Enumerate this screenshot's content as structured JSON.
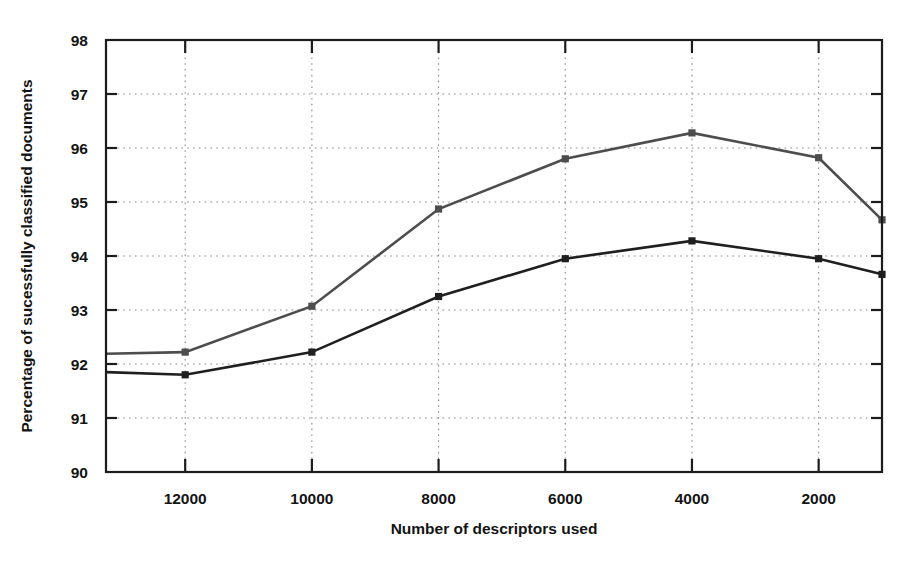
{
  "chart_data": {
    "type": "line",
    "title": "",
    "xlabel": "Number of descriptors used",
    "ylabel": "Percentage of sucessfully classified documents",
    "x": [
      13250,
      12000,
      10000,
      8000,
      6000,
      4000,
      2000,
      1000
    ],
    "xtick_labels": [
      "12000",
      "10000",
      "8000",
      "6000",
      "4000",
      "2000"
    ],
    "xticks": [
      12000,
      10000,
      8000,
      6000,
      4000,
      2000
    ],
    "xlim": [
      13250,
      1000
    ],
    "x_axis_reversed": true,
    "ytick_labels": [
      "90",
      "91",
      "92",
      "93",
      "94",
      "95",
      "96",
      "97",
      "98"
    ],
    "yticks": [
      90,
      91,
      92,
      93,
      94,
      95,
      96,
      97,
      98
    ],
    "ylim": [
      90,
      98
    ],
    "grid": true,
    "grid_style": "dotted",
    "legend": "none",
    "series": [
      {
        "name": "upper-series",
        "color": "#4d4d4d",
        "marker": "square",
        "values": [
          92.19,
          92.22,
          93.07,
          94.87,
          95.8,
          96.28,
          95.82,
          94.67
        ]
      },
      {
        "name": "lower-series",
        "color": "#1f1f1f",
        "marker": "square",
        "values": [
          91.85,
          91.8,
          92.22,
          93.25,
          93.95,
          94.28,
          93.95,
          93.66
        ]
      }
    ],
    "annotations": []
  },
  "figure": {
    "background_color": "#ffffff",
    "axis_color": "#1c1c1c",
    "grid_color": "#8a8a8a"
  }
}
